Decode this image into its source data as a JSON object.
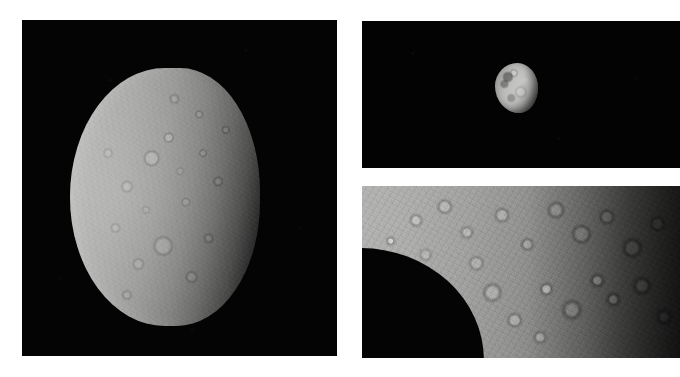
{
  "figure": {
    "background_color": "#ffffff",
    "width": 680,
    "height": 377,
    "panel_count": 3,
    "caption": ""
  },
  "panels": [
    {
      "id": "full-disk",
      "name": "full-disk-moon-panel",
      "description": "Full disk of an icy, heavily cratered moon lit from the left, shown against black space",
      "space_color": "#040404",
      "body_highlight_color": "#b9b9b7",
      "body_shadow_color": "#0a0a0a",
      "x": 22,
      "y": 20,
      "width": 315,
      "height": 336
    },
    {
      "id": "distant-moon",
      "name": "distant-moon-panel",
      "description": "Small distant moon, partially lit, against black space",
      "space_color": "#030303",
      "body_highlight_color": "#c6c6c4",
      "body_shadow_color": "#2a2a2a",
      "x": 362,
      "y": 21,
      "width": 318,
      "height": 147
    },
    {
      "id": "surface-closeup",
      "name": "surface-closeup-panel",
      "description": "High-resolution close-up of the cratered surface and limb, terminator darkening toward the right",
      "space_color": "#040404",
      "surface_light_color": "#b4b4b2",
      "surface_dark_color": "#2c2c2b",
      "x": 362,
      "y": 186,
      "width": 318,
      "height": 172
    }
  ]
}
